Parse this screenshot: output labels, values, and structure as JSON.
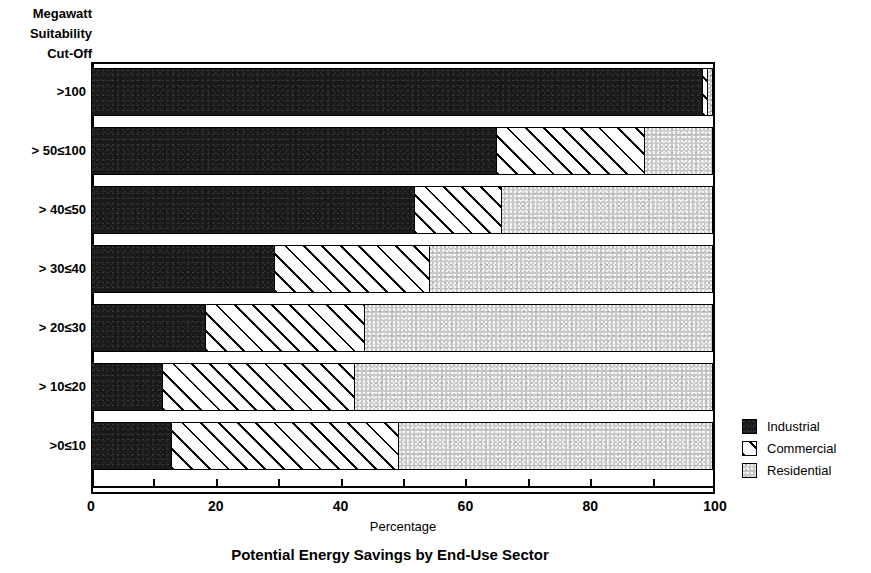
{
  "axis_title": {
    "line1": "Megawatt",
    "line2": "Suitability",
    "line3": "Cut-Off"
  },
  "chart_title": "Potential Energy Savings by End-Use Sector",
  "xlabel": "Percentage",
  "legend": {
    "position": "right",
    "items": [
      {
        "label": "Industrial",
        "key": "industrial",
        "pattern": "solid-dark",
        "color": "#1a1a1a"
      },
      {
        "label": "Commercial",
        "key": "commercial",
        "pattern": "diagonal-hatch",
        "color": "#ffffff"
      },
      {
        "label": "Residential",
        "key": "residential",
        "pattern": "light-stipple",
        "color": "#c8c8c8"
      }
    ]
  },
  "xticks": [
    {
      "value": 0,
      "label": "0"
    },
    {
      "value": 10,
      "label": ""
    },
    {
      "value": 20,
      "label": "20"
    },
    {
      "value": 30,
      "label": ""
    },
    {
      "value": 40,
      "label": "40"
    },
    {
      "value": 50,
      "label": ""
    },
    {
      "value": 60,
      "label": "60"
    },
    {
      "value": 70,
      "label": ""
    },
    {
      "value": 80,
      "label": "80"
    },
    {
      "value": 90,
      "label": ""
    },
    {
      "value": 100,
      "label": "100"
    }
  ],
  "chart_data": {
    "type": "bar",
    "orientation": "horizontal",
    "stacked": true,
    "title": "Potential Energy Savings by End-Use Sector",
    "xlabel": "Percentage",
    "ylabel": "Megawatt Suitability Cut-Off",
    "xlim": [
      0,
      100
    ],
    "xtick_values": [
      0,
      10,
      20,
      30,
      40,
      50,
      60,
      70,
      80,
      90,
      100
    ],
    "xtick_labels": [
      "0",
      "",
      "20",
      "",
      "40",
      "",
      "60",
      "",
      "80",
      "",
      "100"
    ],
    "grid": false,
    "legend_position": "right",
    "categories": [
      ">100",
      "> 50≤100",
      "> 40≤50",
      "> 30≤40",
      "> 20≤30",
      "> 10≤20",
      ">0≤10"
    ],
    "series": [
      {
        "name": "Industrial",
        "values": [
          98,
          65,
          52,
          29.5,
          18.5,
          11.5,
          13
        ]
      },
      {
        "name": "Commercial",
        "values": [
          1,
          24,
          14,
          25,
          25.5,
          31,
          36.5
        ]
      },
      {
        "name": "Residential",
        "values": [
          1,
          11,
          34,
          45.5,
          56,
          57.5,
          50.5
        ]
      }
    ]
  },
  "bars": [
    {
      "label": ">100",
      "top": 6,
      "height": 48,
      "label_top": 22,
      "segments": [
        98,
        1,
        1
      ]
    },
    {
      "label": "> 50≤100",
      "top": 65,
      "height": 48,
      "label_top": 81,
      "segments": [
        65,
        24,
        11
      ]
    },
    {
      "label": "> 40≤50",
      "top": 124,
      "height": 48,
      "label_top": 140,
      "segments": [
        52,
        14,
        34
      ]
    },
    {
      "label": "> 30≤40",
      "top": 183,
      "height": 48,
      "label_top": 199,
      "segments": [
        29.5,
        25,
        45.5
      ]
    },
    {
      "label": "> 20≤30",
      "top": 242,
      "height": 48,
      "label_top": 258,
      "segments": [
        18.5,
        25.5,
        56
      ]
    },
    {
      "label": "> 10≤20",
      "top": 301,
      "height": 48,
      "label_top": 317,
      "segments": [
        11.5,
        31,
        57.5
      ]
    },
    {
      "label": ">0≤10",
      "top": 360,
      "height": 48,
      "label_top": 376,
      "segments": [
        13,
        36.5,
        50.5
      ]
    }
  ]
}
